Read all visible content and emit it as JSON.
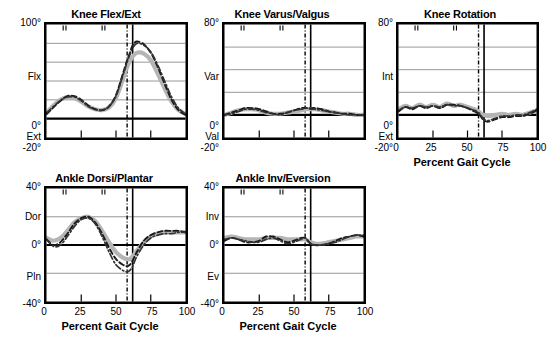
{
  "figure": {
    "xaxis_title": "Percent Gait Cycle",
    "xticks": [
      "0",
      "25",
      "50",
      "75",
      "100"
    ],
    "event_lines": {
      "dashdot_percent": 58,
      "solid_percent": 62
    },
    "top_event_ticks": [
      12,
      14,
      40,
      42
    ],
    "series_names": [
      "mean-band",
      "trial-dashed",
      "trial-dashdot"
    ],
    "colors": {
      "band": "#b5b5b5",
      "dashed": "#1a1a1a",
      "dashdot": "#333333",
      "axis": "#000000",
      "grid": "#8c8c8c"
    }
  },
  "chart_data": [
    {
      "type": "line",
      "id": "knee-flex-ext",
      "title": "Knee Flex/Ext",
      "xlabel": "Percent Gait Cycle",
      "ylabel": "",
      "xlim": [
        0,
        100
      ],
      "ylim": [
        -20,
        100
      ],
      "yticks": [
        -20,
        0,
        20,
        40,
        60,
        80,
        100
      ],
      "ytick_labels": [
        "-20°",
        "0°",
        "",
        "",
        "",
        "",
        "100°"
      ],
      "y_direction_labels": {
        "positive": "Flx",
        "negative": "Ext"
      },
      "grid": true,
      "legend": "none",
      "x": [
        0,
        5,
        10,
        15,
        20,
        25,
        30,
        35,
        40,
        45,
        50,
        55,
        58,
        60,
        62,
        65,
        70,
        75,
        80,
        85,
        90,
        95,
        100
      ],
      "series": [
        {
          "name": "mean-band",
          "style": "thick-gray",
          "values": [
            6,
            14,
            20,
            23,
            22,
            18,
            13,
            10,
            9,
            12,
            22,
            42,
            55,
            61,
            66,
            70,
            69,
            62,
            48,
            32,
            18,
            9,
            5
          ]
        },
        {
          "name": "trial-dashed",
          "style": "dashed-black",
          "values": [
            5,
            12,
            19,
            24,
            24,
            20,
            14,
            10,
            9,
            13,
            25,
            48,
            62,
            70,
            78,
            82,
            79,
            70,
            55,
            37,
            20,
            9,
            4
          ]
        },
        {
          "name": "trial-dashdot",
          "style": "dashdot-black",
          "values": [
            6,
            13,
            19,
            23,
            23,
            19,
            13,
            10,
            9,
            13,
            24,
            46,
            60,
            68,
            75,
            80,
            78,
            71,
            57,
            40,
            23,
            11,
            5
          ]
        }
      ]
    },
    {
      "type": "line",
      "id": "knee-varus-valgus",
      "title": "Knee Varus/Valgus",
      "xlabel": "Percent Gait Cycle",
      "ylabel": "",
      "xlim": [
        0,
        100
      ],
      "ylim": [
        -20,
        80
      ],
      "yticks": [
        -20,
        0,
        20,
        40,
        60,
        80
      ],
      "ytick_labels": [
        "-20°",
        "0°",
        "",
        "",
        "",
        "80°"
      ],
      "y_direction_labels": {
        "positive": "Var",
        "negative": "Val"
      },
      "grid": true,
      "legend": "none",
      "x": [
        0,
        5,
        10,
        15,
        20,
        25,
        30,
        35,
        40,
        45,
        50,
        55,
        58,
        60,
        62,
        65,
        70,
        75,
        80,
        85,
        90,
        95,
        100
      ],
      "series": [
        {
          "name": "mean-band",
          "style": "thick-gray",
          "values": [
            0,
            2,
            4,
            5,
            5,
            4,
            2,
            1,
            1,
            2,
            3,
            4,
            5,
            5,
            5,
            5,
            4,
            3,
            2,
            1,
            1,
            0,
            0
          ]
        },
        {
          "name": "trial-dashed",
          "style": "dashed-black",
          "values": [
            0,
            2,
            4,
            6,
            6,
            5,
            3,
            1,
            1,
            2,
            4,
            6,
            6,
            6,
            6,
            6,
            5,
            3,
            2,
            1,
            1,
            0,
            0
          ]
        },
        {
          "name": "trial-dashdot",
          "style": "dashdot-black",
          "values": [
            0,
            1,
            3,
            5,
            5,
            4,
            2,
            1,
            0,
            2,
            4,
            5,
            6,
            6,
            5,
            5,
            4,
            3,
            2,
            1,
            0,
            0,
            0
          ]
        }
      ]
    },
    {
      "type": "line",
      "id": "knee-rotation",
      "title": "Knee Rotation",
      "xlabel": "Percent Gait Cycle",
      "ylabel": "",
      "xlim": [
        0,
        100
      ],
      "ylim": [
        -20,
        80
      ],
      "yticks": [
        -20,
        0,
        20,
        40,
        60,
        80
      ],
      "ytick_labels": [
        "-20°",
        "0°",
        "",
        "",
        "",
        "80°"
      ],
      "y_direction_labels": {
        "positive": "Int",
        "negative": "Ext"
      },
      "grid": true,
      "legend": "none",
      "x": [
        0,
        5,
        10,
        15,
        20,
        25,
        30,
        35,
        40,
        45,
        50,
        55,
        58,
        60,
        62,
        65,
        70,
        75,
        80,
        85,
        90,
        95,
        100
      ],
      "series": [
        {
          "name": "mean-band",
          "style": "thick-gray",
          "values": [
            5,
            8,
            6,
            9,
            7,
            9,
            7,
            10,
            8,
            9,
            7,
            5,
            3,
            1,
            0,
            -1,
            0,
            1,
            0,
            1,
            0,
            2,
            4
          ]
        },
        {
          "name": "trial-dashed",
          "style": "dashed-black",
          "values": [
            3,
            7,
            5,
            8,
            6,
            8,
            6,
            9,
            9,
            8,
            6,
            3,
            1,
            -2,
            -5,
            -6,
            -4,
            -2,
            -2,
            -1,
            -1,
            1,
            4
          ]
        },
        {
          "name": "trial-dashdot",
          "style": "dashdot-black",
          "values": [
            4,
            7,
            6,
            8,
            7,
            8,
            7,
            9,
            8,
            8,
            6,
            4,
            2,
            -1,
            -4,
            -5,
            -3,
            -1,
            -1,
            0,
            0,
            2,
            5
          ]
        }
      ]
    },
    {
      "type": "line",
      "id": "ankle-dorsi-plantar",
      "title": "Ankle Dorsi/Plantar",
      "xlabel": "Percent Gait Cycle",
      "ylabel": "",
      "xlim": [
        0,
        100
      ],
      "ylim": [
        -40,
        40
      ],
      "yticks": [
        -40,
        -20,
        0,
        20,
        40
      ],
      "ytick_labels": [
        "-40°",
        "",
        "0°",
        "",
        "40°"
      ],
      "y_direction_labels": {
        "positive": "Dor",
        "negative": "Pln"
      },
      "grid": true,
      "legend": "none",
      "x": [
        0,
        5,
        10,
        15,
        20,
        25,
        30,
        35,
        40,
        45,
        50,
        55,
        58,
        60,
        62,
        65,
        70,
        75,
        80,
        85,
        90,
        95,
        100
      ],
      "series": [
        {
          "name": "mean-band",
          "style": "thick-gray",
          "values": [
            5,
            3,
            5,
            10,
            16,
            19,
            20,
            17,
            10,
            2,
            -5,
            -9,
            -10,
            -10,
            -8,
            -4,
            2,
            6,
            8,
            9,
            9,
            9,
            9
          ]
        },
        {
          "name": "trial-dashed",
          "style": "dashed-black",
          "values": [
            4,
            0,
            2,
            8,
            15,
            19,
            20,
            16,
            8,
            -2,
            -10,
            -14,
            -15,
            -14,
            -11,
            -5,
            3,
            7,
            9,
            10,
            10,
            10,
            9
          ]
        },
        {
          "name": "trial-dashdot",
          "style": "dashdot-black",
          "values": [
            4,
            -1,
            0,
            6,
            13,
            18,
            19,
            15,
            6,
            -5,
            -14,
            -18,
            -19,
            -18,
            -15,
            -8,
            0,
            5,
            7,
            8,
            8,
            9,
            9
          ]
        }
      ]
    },
    {
      "type": "line",
      "id": "ankle-inv-eversion",
      "title": "Ankle Inv/Eversion",
      "xlabel": "Percent Gait Cycle",
      "ylabel": "",
      "xlim": [
        0,
        100
      ],
      "ylim": [
        -40,
        40
      ],
      "yticks": [
        -40,
        -20,
        0,
        20,
        40
      ],
      "ytick_labels": [
        "-40°",
        "",
        "0°",
        "",
        "40°"
      ],
      "y_direction_labels": {
        "positive": "Inv",
        "negative": "Ev"
      },
      "grid": true,
      "legend": "none",
      "x": [
        0,
        5,
        10,
        15,
        20,
        25,
        30,
        35,
        40,
        45,
        50,
        55,
        58,
        60,
        62,
        65,
        70,
        75,
        80,
        85,
        90,
        95,
        100
      ],
      "series": [
        {
          "name": "mean-band",
          "style": "thick-gray",
          "values": [
            5,
            6,
            5,
            4,
            4,
            4,
            5,
            5,
            5,
            4,
            4,
            4,
            4,
            3,
            2,
            1,
            1,
            2,
            3,
            4,
            5,
            6,
            6
          ]
        },
        {
          "name": "trial-dashed",
          "style": "dashed-black",
          "values": [
            3,
            5,
            4,
            2,
            2,
            3,
            6,
            6,
            4,
            2,
            3,
            5,
            5,
            3,
            1,
            0,
            0,
            1,
            3,
            5,
            6,
            7,
            6
          ]
        },
        {
          "name": "trial-dashdot",
          "style": "dashdot-black",
          "values": [
            4,
            5,
            4,
            3,
            2,
            2,
            4,
            5,
            3,
            1,
            2,
            4,
            5,
            3,
            1,
            0,
            0,
            1,
            2,
            4,
            6,
            7,
            7
          ]
        }
      ]
    }
  ],
  "panels": [
    {
      "id": "knee-flex-ext",
      "title": "Knee Flex/Ext"
    },
    {
      "id": "knee-varus-valgus",
      "title": "Knee Varus/Valgus"
    },
    {
      "id": "knee-rotation",
      "title": "Knee Rotation"
    },
    {
      "id": "ankle-dorsi-plantar",
      "title": "Ankle Dorsi/Plantar"
    },
    {
      "id": "ankle-inv-eversion",
      "title": "Ankle Inv/Eversion"
    }
  ]
}
